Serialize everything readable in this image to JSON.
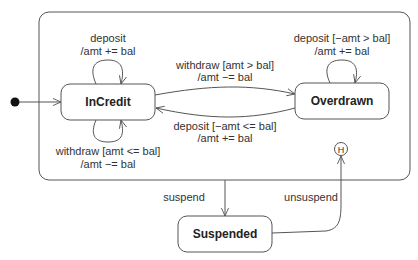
{
  "diagram": {
    "type": "UML state machine",
    "composite_state": {
      "name": ""
    },
    "states": [
      {
        "id": "incredit",
        "label": "InCredit"
      },
      {
        "id": "overdrawn",
        "label": "Overdrawn"
      },
      {
        "id": "suspended",
        "label": "Suspended"
      }
    ],
    "pseudostates": {
      "initial": "initial",
      "history": "H"
    },
    "transitions": {
      "incredit_self_top": {
        "line1": "deposit",
        "line2": "/amt += bal"
      },
      "incredit_self_bottom": {
        "line1": "withdraw [amt <= bal]",
        "line2": "/amt −= bal"
      },
      "incredit_to_overdrawn": {
        "line1": "withdraw [amt > bal]",
        "line2": "/amt −= bal"
      },
      "overdrawn_to_incredit": {
        "line1": "deposit [−amt <= bal]",
        "line2": "/amt += bal"
      },
      "overdrawn_self_top": {
        "line1": "deposit [−amt > bal]",
        "line2": "/amt += bal"
      },
      "suspend": {
        "label": "suspend"
      },
      "unsuspend": {
        "label": "unsuspend"
      }
    },
    "colors": {
      "stroke": "#555555",
      "text": "#333333",
      "background": "#ffffff"
    }
  }
}
